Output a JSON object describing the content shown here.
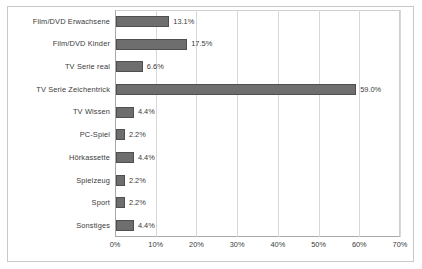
{
  "chart_data": {
    "type": "bar",
    "orientation": "horizontal",
    "title": "",
    "xlabel": "",
    "ylabel": "",
    "xlim": [
      0,
      70
    ],
    "grid": true,
    "legend": "none",
    "xticks": [
      "0%",
      "10%",
      "20%",
      "30%",
      "40%",
      "50%",
      "60%",
      "70%"
    ],
    "xtick_values": [
      0,
      10,
      20,
      30,
      40,
      50,
      60,
      70
    ],
    "categories": [
      "Film/DVD Erwachsene",
      "Film/DVD Kinder",
      "TV Serie real",
      "TV Serie Zeichentrick",
      "TV Wissen",
      "PC-Spiel",
      "Hörkassette",
      "Spielzeug",
      "Sport",
      "Sonstiges"
    ],
    "values": [
      13.1,
      17.5,
      6.6,
      59.0,
      4.4,
      2.2,
      4.4,
      2.2,
      2.2,
      4.4
    ],
    "value_labels": [
      "13.1%",
      "17.5%",
      "6.6%",
      "59.0%",
      "4.4%",
      "2.2%",
      "4.4%",
      "2.2%",
      "2.2%",
      "4.4%"
    ],
    "colors": {
      "bar_fill": "#6e6e6e",
      "bar_border": "#4f4f4f",
      "gridline": "#d8d8d8",
      "axis": "#a8a8a8",
      "frame": "#c9c9c9",
      "text": "#3a3a3a",
      "background": "#ffffff"
    }
  }
}
